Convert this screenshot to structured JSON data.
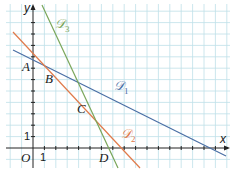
{
  "diagram": {
    "type": "coordinate-plane-lines",
    "axes": {
      "x_label": "x",
      "y_label": "y",
      "origin_label": "O",
      "x_tick_label": "1",
      "y_tick_label": "1"
    },
    "points": {
      "A": "A",
      "B": "B",
      "C": "C",
      "D": "D"
    },
    "lines": [
      {
        "name": "D1",
        "script": "𝒟",
        "sub": "1",
        "color": "#4a6fa5"
      },
      {
        "name": "D2",
        "script": "𝒟",
        "sub": "2",
        "color": "#e07a4a"
      },
      {
        "name": "D3",
        "script": "𝒟",
        "sub": "3",
        "color": "#7aa65a"
      }
    ],
    "colors": {
      "grid": "#b9dde6",
      "axis": "#222222"
    }
  }
}
